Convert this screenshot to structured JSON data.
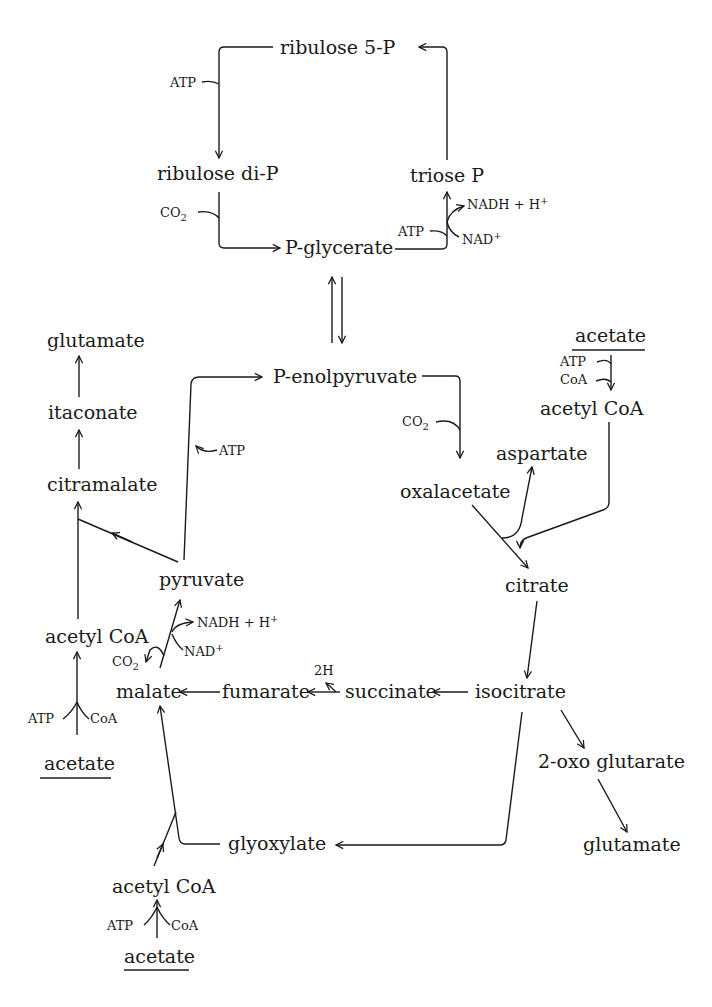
{
  "diagram": {
    "type": "metabolic-pathway",
    "nodes": {
      "ribulose5p": "ribulose 5-P",
      "ribulose_dip": "ribulose di-P",
      "triose_p": "triose P",
      "p_glycerate": "P-glycerate",
      "p_enolpyruvate": "P-enolpyruvate",
      "glutamate_left": "glutamate",
      "itaconate": "itaconate",
      "citramalate": "citramalate",
      "pyruvate": "pyruvate",
      "acetyl_coa_left": "acetyl CoA",
      "acetate_left": "acetate",
      "malate": "malate",
      "fumarate": "fumarate",
      "succinate": "succinate",
      "isocitrate": "isocitrate",
      "citrate": "citrate",
      "oxalacetate": "oxalacetate",
      "aspartate": "aspartate",
      "acetate_right": "acetate",
      "acetyl_coa_right": "acetyl CoA",
      "oxo_glutarate": "2-oxo glutarate",
      "glutamate_right": "glutamate",
      "glyoxylate": "glyoxylate",
      "acetyl_coa_bottom": "acetyl CoA",
      "acetate_bottom": "acetate"
    },
    "cofactors": {
      "atp_ribulose": "ATP",
      "co2_ribulose": "CO2",
      "atp_triose": "ATP",
      "nadh_triose": "NADH + H+",
      "nad_triose": "NAD+",
      "atp_pep": "ATP",
      "co2_oxalacetate": "CO2",
      "atp_acetate_right": "ATP",
      "coa_acetate_right": "CoA",
      "nadh_pyruvate": "NADH + H+",
      "nad_pyruvate": "NAD+",
      "co2_malate": "CO2",
      "h2_succinate": "2H",
      "atp_acetate_left": "ATP",
      "coa_acetate_left": "CoA",
      "atp_acetate_bottom": "ATP",
      "coa_acetate_bottom": "CoA"
    },
    "edges": [
      {
        "from": "triose P",
        "to": "ribulose 5-P"
      },
      {
        "from": "ribulose 5-P",
        "to": "ribulose di-P",
        "cofactor_in": "ATP"
      },
      {
        "from": "ribulose di-P",
        "to": "P-glycerate",
        "cofactor_in": "CO2"
      },
      {
        "from": "P-glycerate",
        "to": "triose P",
        "cofactor_in": "ATP, NADH + H+",
        "cofactor_out": "NAD+"
      },
      {
        "from": "P-glycerate",
        "to": "P-enolpyruvate",
        "reversible": true
      },
      {
        "from": "pyruvate",
        "to": "P-enolpyruvate",
        "cofactor_in": "ATP"
      },
      {
        "from": "P-enolpyruvate",
        "to": "oxalacetate",
        "cofactor_in": "CO2"
      },
      {
        "from": "oxalacetate",
        "to": "aspartate"
      },
      {
        "from": "acetate",
        "to": "acetyl CoA",
        "cofactor_in": "ATP, CoA"
      },
      {
        "from": "oxalacetate + acetyl CoA",
        "to": "citrate"
      },
      {
        "from": "citrate",
        "to": "isocitrate"
      },
      {
        "from": "isocitrate",
        "to": "2-oxo glutarate"
      },
      {
        "from": "2-oxo glutarate",
        "to": "glutamate"
      },
      {
        "from": "isocitrate",
        "to": "succinate"
      },
      {
        "from": "isocitrate",
        "to": "glyoxylate"
      },
      {
        "from": "succinate",
        "to": "fumarate",
        "cofactor_out": "2H"
      },
      {
        "from": "fumarate",
        "to": "malate"
      },
      {
        "from": "glyoxylate + acetyl CoA",
        "to": "malate"
      },
      {
        "from": "malate",
        "to": "pyruvate",
        "cofactor_in": "NAD+",
        "cofactor_out": "NADH + H+, CO2"
      },
      {
        "from": "pyruvate + acetyl CoA",
        "to": "citramalate"
      },
      {
        "from": "citramalate",
        "to": "itaconate"
      },
      {
        "from": "itaconate",
        "to": "glutamate"
      }
    ]
  }
}
